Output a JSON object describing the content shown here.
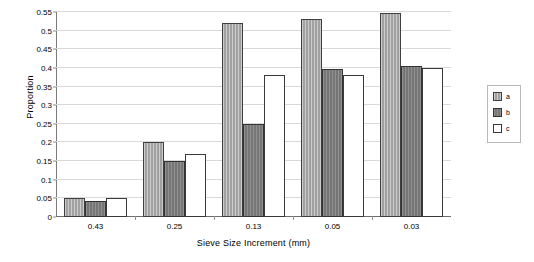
{
  "chart_data": {
    "type": "bar",
    "title": "",
    "xlabel": "Sieve Size Increment (mm)",
    "ylabel": "Proportion",
    "categories": [
      "0.43",
      "0.25",
      "0.13",
      "0.05",
      "0.03"
    ],
    "series": [
      {
        "name": "a",
        "values": [
          0.05,
          0.2,
          0.52,
          0.53,
          0.548
        ],
        "color": "#a8a8a8"
      },
      {
        "name": "b",
        "values": [
          0.043,
          0.149,
          0.25,
          0.398,
          0.406
        ],
        "color": "#7c7c7c"
      },
      {
        "name": "c",
        "values": [
          0.05,
          0.168,
          0.38,
          0.381,
          0.4
        ],
        "color": "#ffffff"
      }
    ],
    "ylim": [
      0,
      0.55
    ],
    "ytick_labels": [
      "0",
      "0.05",
      "0.1",
      "0.15",
      "0.2",
      "0.25",
      "0.3",
      "0.35",
      "0.4",
      "0.45",
      "0.5",
      "0.55"
    ],
    "ytick_values": [
      0,
      0.05,
      0.1,
      0.15,
      0.2,
      0.25,
      0.3,
      0.35,
      0.4,
      0.45,
      0.5,
      0.55
    ],
    "grid": true,
    "legend_position": "right",
    "legend_entries": [
      "a",
      "b",
      "c"
    ]
  }
}
